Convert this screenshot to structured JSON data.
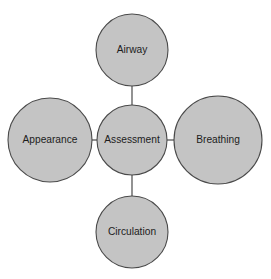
{
  "diagram": {
    "type": "hub-and-spoke",
    "title": "Assessment",
    "style": {
      "node_fill": "#c4c4c4",
      "node_stroke": "#4a4a4a",
      "connector_color": "#4a4a4a",
      "label_color": "#1c1c1c",
      "background": "#ffffff"
    },
    "center_node": {
      "label": "Assessment",
      "cx": 132,
      "cy": 140,
      "r": 35
    },
    "nodes": [
      {
        "id": "airway",
        "label": "Airway",
        "cx": 132,
        "cy": 50,
        "r": 36,
        "position": "top"
      },
      {
        "id": "breathing",
        "label": "Breathing",
        "cx": 218,
        "cy": 140,
        "r": 44,
        "position": "right"
      },
      {
        "id": "circulation",
        "label": "Circulation",
        "cx": 132,
        "cy": 232,
        "r": 36,
        "position": "bottom"
      },
      {
        "id": "appearance",
        "label": "Appearance",
        "cx": 50,
        "cy": 140,
        "r": 42,
        "position": "left"
      }
    ],
    "connectors": [
      {
        "id": "center-airway",
        "from": "center",
        "to": "airway",
        "x1": 132,
        "y1": 105,
        "x2": 132,
        "y2": 86
      },
      {
        "id": "center-breathing",
        "from": "center",
        "to": "breathing",
        "x1": 167,
        "y1": 140,
        "x2": 174,
        "y2": 140
      },
      {
        "id": "center-circulation",
        "from": "center",
        "to": "circulation",
        "x1": 132,
        "y1": 175,
        "x2": 132,
        "y2": 196
      },
      {
        "id": "center-appearance",
        "from": "center",
        "to": "appearance",
        "x1": 97,
        "y1": 140,
        "x2": 92,
        "y2": 140
      }
    ]
  }
}
